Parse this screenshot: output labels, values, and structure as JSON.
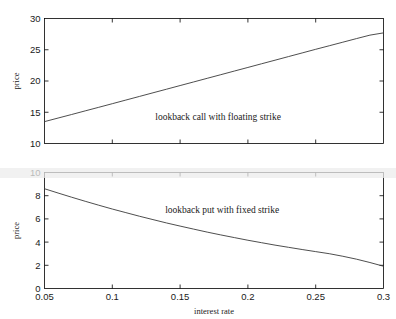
{
  "chart_data": [
    {
      "type": "line",
      "panel": "top",
      "title": "",
      "xlabel": "",
      "ylabel": "price",
      "xlim": [
        0.05,
        0.3
      ],
      "ylim": [
        10,
        30
      ],
      "xticks": [
        0.05,
        0.1,
        0.15,
        0.2,
        0.25,
        0.3
      ],
      "xticklabels": [
        "",
        "",
        "",
        "",
        "",
        ""
      ],
      "yticks": [
        10,
        15,
        20,
        25,
        30
      ],
      "yticklabels": [
        "10",
        "15",
        "20",
        "25",
        "30"
      ],
      "grid": false,
      "legend": "none",
      "annotations": [
        {
          "text": "lookback call with floating strike",
          "x": 0.178,
          "y": 13.7
        }
      ],
      "series": [
        {
          "name": "lookback call with floating strike",
          "x": [
            0.05,
            0.06,
            0.07,
            0.08,
            0.09,
            0.1,
            0.11,
            0.12,
            0.13,
            0.14,
            0.15,
            0.16,
            0.17,
            0.18,
            0.19,
            0.2,
            0.21,
            0.22,
            0.23,
            0.24,
            0.25,
            0.26,
            0.27,
            0.28,
            0.29,
            0.3
          ],
          "values": [
            13.5,
            14.07,
            14.64,
            15.22,
            15.79,
            16.37,
            16.95,
            17.53,
            18.11,
            18.69,
            19.27,
            19.85,
            20.43,
            21.01,
            21.59,
            22.17,
            22.75,
            23.33,
            23.91,
            24.49,
            25.07,
            25.64,
            26.21,
            26.78,
            27.34,
            27.7
          ]
        }
      ]
    },
    {
      "type": "line",
      "panel": "bottom",
      "title": "",
      "xlabel": "interest rate",
      "ylabel": "price",
      "xlim": [
        0.05,
        0.3
      ],
      "ylim": [
        0,
        10
      ],
      "xticks": [
        0.05,
        0.1,
        0.15,
        0.2,
        0.25,
        0.3
      ],
      "xticklabels": [
        "0.05",
        "0.1",
        "0.15",
        "0.2",
        "0.25",
        "0.3"
      ],
      "yticks": [
        0,
        2,
        4,
        6,
        8,
        10
      ],
      "yticklabels": [
        "0",
        "2",
        "4",
        "6",
        "8",
        "10"
      ],
      "grid": false,
      "legend": "none",
      "annotations": [
        {
          "text": "lookback put with fixed strike",
          "x": 0.181,
          "y": 6.55
        }
      ],
      "series": [
        {
          "name": "lookback put with fixed strike",
          "x": [
            0.05,
            0.06,
            0.07,
            0.08,
            0.09,
            0.1,
            0.11,
            0.12,
            0.13,
            0.14,
            0.15,
            0.16,
            0.17,
            0.18,
            0.19,
            0.2,
            0.21,
            0.22,
            0.23,
            0.24,
            0.25,
            0.26,
            0.27,
            0.28,
            0.29,
            0.3
          ],
          "values": [
            8.6,
            8.23,
            7.87,
            7.52,
            7.18,
            6.85,
            6.54,
            6.23,
            5.94,
            5.65,
            5.38,
            5.12,
            4.86,
            4.62,
            4.39,
            4.16,
            3.95,
            3.74,
            3.55,
            3.36,
            3.18,
            3.0,
            2.78,
            2.53,
            2.24,
            1.92
          ]
        }
      ]
    }
  ]
}
